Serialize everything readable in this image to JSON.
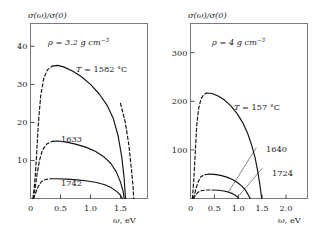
{
  "figure": {
    "ylabel": "σ(ω)/σ(0)",
    "xlabel_symbol": "ω",
    "xlabel_unit": ", eV"
  },
  "chart_data": [
    {
      "type": "line",
      "panel": "left",
      "title": "",
      "xlabel": "ω, eV",
      "ylabel": "σ(ω)/σ(0)",
      "xlim": [
        0,
        1.95
      ],
      "ylim": [
        0,
        46
      ],
      "xticks": [
        0,
        0.5,
        1.0,
        1.5
      ],
      "xticklabels": [
        "0",
        "0.5",
        "1.0",
        "1.5"
      ],
      "yticks": [
        10,
        20,
        30,
        40
      ],
      "yticklabels": [
        "10",
        "20",
        "30",
        "40"
      ],
      "grid": false,
      "annotation": {
        "density_symbol": "ρ",
        "density_text": " = 3.2 g cm",
        "density_exp": "−3"
      },
      "series": [
        {
          "name": "T = 1582 °C",
          "label": "T = 1582 °C",
          "label_symbol": "T",
          "label_text": " = 1582 °C",
          "rising_dashed": [
            [
              0.04,
              0.0
            ],
            [
              0.07,
              4.0
            ],
            [
              0.1,
              11.0
            ],
            [
              0.13,
              19.5
            ],
            [
              0.17,
              27.0
            ],
            [
              0.22,
              31.5
            ],
            [
              0.28,
              33.8
            ],
            [
              0.36,
              34.8
            ]
          ],
          "main_solid": [
            [
              0.36,
              34.8
            ],
            [
              0.45,
              35.0
            ],
            [
              0.55,
              34.6
            ],
            [
              0.7,
              33.5
            ],
            [
              0.85,
              32.0
            ],
            [
              1.0,
              30.0
            ],
            [
              1.15,
              27.4
            ],
            [
              1.28,
              24.4
            ],
            [
              1.38,
              21.0
            ],
            [
              1.46,
              16.5
            ],
            [
              1.52,
              11.0
            ],
            [
              1.56,
              5.5
            ],
            [
              1.58,
              0.8
            ],
            [
              1.585,
              0.0
            ]
          ],
          "falling_dashed": [
            [
              1.5,
              25.0
            ],
            [
              1.58,
              20.0
            ],
            [
              1.64,
              14.0
            ],
            [
              1.68,
              8.0
            ],
            [
              1.71,
              3.0
            ],
            [
              1.72,
              0.0
            ]
          ]
        },
        {
          "name": "1633",
          "label": "1633",
          "rising_dashed": [
            [
              0.05,
              0.0
            ],
            [
              0.08,
              3.0
            ],
            [
              0.11,
              6.5
            ],
            [
              0.15,
              10.0
            ],
            [
              0.2,
              12.8
            ],
            [
              0.27,
              14.3
            ],
            [
              0.36,
              15.0
            ]
          ],
          "main_solid": [
            [
              0.36,
              15.0
            ],
            [
              0.45,
              15.1
            ],
            [
              0.58,
              14.9
            ],
            [
              0.75,
              14.3
            ],
            [
              0.92,
              13.5
            ],
            [
              1.08,
              12.4
            ],
            [
              1.22,
              11.0
            ],
            [
              1.34,
              9.2
            ],
            [
              1.43,
              7.0
            ],
            [
              1.5,
              4.3
            ],
            [
              1.545,
              1.8
            ],
            [
              1.56,
              0.0
            ]
          ],
          "falling_dashed": []
        },
        {
          "name": "1742",
          "label": "1742",
          "rising_dashed": [
            [
              0.05,
              0.0
            ],
            [
              0.09,
              1.6
            ],
            [
              0.13,
              3.2
            ],
            [
              0.18,
              4.4
            ],
            [
              0.25,
              5.0
            ],
            [
              0.33,
              5.2
            ]
          ],
          "main_solid": [
            [
              0.33,
              5.2
            ],
            [
              0.45,
              5.2
            ],
            [
              0.6,
              5.1
            ],
            [
              0.78,
              4.9
            ],
            [
              0.95,
              4.6
            ],
            [
              1.1,
              4.2
            ],
            [
              1.24,
              3.6
            ],
            [
              1.35,
              2.8
            ],
            [
              1.44,
              1.8
            ],
            [
              1.5,
              0.8
            ],
            [
              1.53,
              0.0
            ]
          ],
          "falling_dashed": []
        }
      ]
    },
    {
      "type": "line",
      "panel": "right",
      "title": "",
      "xlabel": "ω, eV",
      "ylabel": "σ(ω)/σ(0)",
      "xlim": [
        0,
        2.45
      ],
      "ylim": [
        0,
        360
      ],
      "xticks": [
        0,
        0.5,
        1.0,
        1.5,
        2.0
      ],
      "xticklabels": [
        "0",
        "0.5",
        "1.0",
        "1.5",
        "2.0"
      ],
      "yticks": [
        100,
        200,
        300
      ],
      "yticklabels": [
        "100",
        "200",
        "300"
      ],
      "grid": false,
      "annotation": {
        "density_symbol": "ρ",
        "density_text": " = 4 g cm",
        "density_exp": "−3"
      },
      "series": [
        {
          "name": "T = 157 °C",
          "label": "T = 157 °C",
          "label_symbol": "T",
          "label_text": " = 157 °C",
          "rising_dashed": [
            [
              0.04,
              0.0
            ],
            [
              0.07,
              40.0
            ],
            [
              0.1,
              95.0
            ],
            [
              0.13,
              150.0
            ],
            [
              0.17,
              185.0
            ],
            [
              0.22,
              205.0
            ],
            [
              0.28,
              214.0
            ],
            [
              0.34,
              217.0
            ]
          ],
          "main_solid": [
            [
              0.34,
              217.0
            ],
            [
              0.45,
              216.0
            ],
            [
              0.58,
              211.0
            ],
            [
              0.72,
              202.0
            ],
            [
              0.85,
              190.0
            ],
            [
              0.98,
              174.0
            ],
            [
              1.1,
              155.0
            ],
            [
              1.2,
              133.0
            ],
            [
              1.28,
              110.0
            ],
            [
              1.35,
              85.0
            ],
            [
              1.4,
              60.0
            ],
            [
              1.44,
              36.0
            ],
            [
              1.47,
              16.0
            ],
            [
              1.49,
              0.0
            ]
          ],
          "falling_dashed": []
        },
        {
          "name": "1640",
          "label": "1640",
          "rising_dashed": [
            [
              0.06,
              0.0
            ],
            [
              0.1,
              14.0
            ],
            [
              0.15,
              32.0
            ],
            [
              0.21,
              44.0
            ],
            [
              0.29,
              49.0
            ],
            [
              0.38,
              50.0
            ]
          ],
          "main_solid": [
            [
              0.38,
              50.0
            ],
            [
              0.5,
              49.5
            ],
            [
              0.63,
              47.5
            ],
            [
              0.76,
              44.0
            ],
            [
              0.88,
              39.0
            ],
            [
              0.99,
              32.5
            ],
            [
              1.08,
              25.0
            ],
            [
              1.15,
              17.0
            ],
            [
              1.2,
              9.0
            ],
            [
              1.24,
              2.0
            ],
            [
              1.25,
              0.0
            ]
          ],
          "falling_dashed": []
        },
        {
          "name": "1724",
          "label": "1724",
          "rising_dashed": [
            [
              0.06,
              0.0
            ],
            [
              0.1,
              6.0
            ],
            [
              0.16,
              13.0
            ],
            [
              0.24,
              16.5
            ],
            [
              0.34,
              17.5
            ],
            [
              0.45,
              17.5
            ]
          ],
          "main_solid": [
            [
              0.45,
              17.5
            ],
            [
              0.58,
              17.0
            ],
            [
              0.7,
              15.5
            ],
            [
              0.8,
              13.0
            ],
            [
              0.88,
              10.0
            ],
            [
              0.94,
              6.5
            ],
            [
              0.98,
              3.0
            ],
            [
              1.0,
              0.0
            ]
          ],
          "falling_dashed": []
        }
      ],
      "leaders": [
        {
          "name": "leader-1640",
          "x1": 1.38,
          "y1": 105,
          "x2": 0.8,
          "y2": 14
        },
        {
          "name": "leader-1724",
          "x1": 1.5,
          "y1": 62,
          "x2": 1.0,
          "y2": 4
        }
      ]
    }
  ]
}
